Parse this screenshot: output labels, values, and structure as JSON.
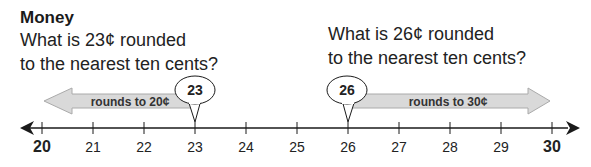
{
  "title": "Money",
  "questions": [
    {
      "line1": "What is 23¢ rounded",
      "line2": "to the nearest ten cents?"
    },
    {
      "line1": "What is 26¢ rounded",
      "line2": "to the nearest ten cents?"
    }
  ],
  "number_line": {
    "ticks": [
      "20",
      "21",
      "22",
      "23",
      "24",
      "25",
      "26",
      "27",
      "28",
      "29",
      "30"
    ],
    "bold_ticks": [
      "20",
      "30"
    ]
  },
  "markers": [
    {
      "value": "23",
      "arrow_label": "rounds to 20¢",
      "direction": "left"
    },
    {
      "value": "26",
      "arrow_label": "rounds to 30¢",
      "direction": "right"
    }
  ],
  "colors": {
    "arrow_fill": "#d9d9d9",
    "arrow_stroke": "#aaaaaa",
    "line": "#1a1a1a"
  }
}
